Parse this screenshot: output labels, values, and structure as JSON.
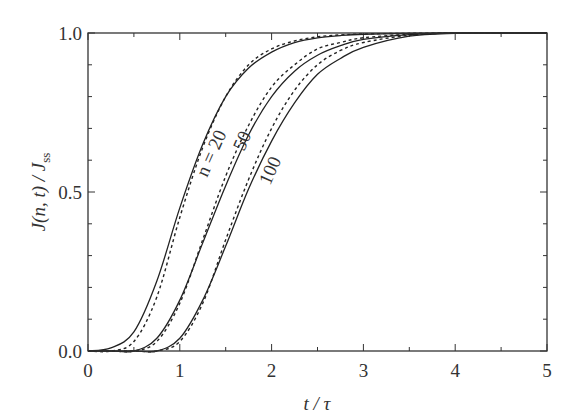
{
  "chart_data": {
    "type": "line",
    "title": "",
    "xlabel": "t / τ",
    "ylabel": "J(n, t) / J_ss",
    "xlim": [
      0,
      5
    ],
    "ylim": [
      0,
      1
    ],
    "x_ticks": [
      "0",
      "1",
      "2",
      "3",
      "4",
      "5"
    ],
    "y_ticks": [
      "0.0",
      "0.5",
      "1.0"
    ],
    "grid": false,
    "legend": "inline labels on curves",
    "annotations": [
      "n = 20",
      "50",
      "100"
    ],
    "x": [
      0,
      0.25,
      0.5,
      0.75,
      1.0,
      1.25,
      1.5,
      1.75,
      2.0,
      2.25,
      2.5,
      2.75,
      3.0,
      3.5,
      4.0,
      4.5,
      5.0
    ],
    "series": [
      {
        "name": "n = 20 (solid)",
        "style": "solid",
        "values": [
          0,
          0.01,
          0.06,
          0.22,
          0.45,
          0.65,
          0.8,
          0.89,
          0.94,
          0.97,
          0.985,
          0.992,
          0.996,
          0.999,
          1.0,
          1.0,
          1.0
        ]
      },
      {
        "name": "n = 20 (dashed)",
        "style": "dashed",
        "values": [
          0,
          0.0,
          0.03,
          0.17,
          0.42,
          0.64,
          0.8,
          0.9,
          0.95,
          0.975,
          0.988,
          0.994,
          0.997,
          0.999,
          1.0,
          1.0,
          1.0
        ]
      },
      {
        "name": "n = 50 (solid)",
        "style": "solid",
        "values": [
          0,
          0,
          0.0,
          0.04,
          0.16,
          0.34,
          0.52,
          0.68,
          0.8,
          0.88,
          0.93,
          0.96,
          0.98,
          0.995,
          1.0,
          1.0,
          1.0
        ]
      },
      {
        "name": "n = 50 (dashed)",
        "style": "dashed",
        "values": [
          0,
          0,
          0.0,
          0.03,
          0.15,
          0.35,
          0.55,
          0.71,
          0.83,
          0.9,
          0.95,
          0.97,
          0.985,
          0.996,
          1.0,
          1.0,
          1.0
        ]
      },
      {
        "name": "n = 100 (solid)",
        "style": "solid",
        "values": [
          0,
          0,
          0,
          0.0,
          0.04,
          0.16,
          0.33,
          0.51,
          0.66,
          0.78,
          0.87,
          0.92,
          0.955,
          0.99,
          0.999,
          1.0,
          1.0
        ]
      },
      {
        "name": "n = 100 (dashed)",
        "style": "dashed",
        "values": [
          0,
          0,
          0,
          0.0,
          0.03,
          0.15,
          0.35,
          0.54,
          0.7,
          0.82,
          0.9,
          0.945,
          0.97,
          0.993,
          1.0,
          1.0,
          1.0
        ]
      }
    ]
  },
  "labels": {
    "xlabel": "t / τ",
    "ylabel_main": "J(n, t) / J",
    "ylabel_sub": "ss",
    "n20": "n = 20",
    "n50": "50",
    "n100": "100"
  }
}
